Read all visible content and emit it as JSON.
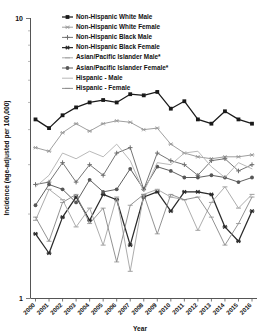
{
  "chart_data": {
    "type": "line",
    "title": "",
    "xlabel": "Year",
    "ylabel": "Incidence (age-adjusted per 100,000)",
    "yscale": "log",
    "ylim": [
      1,
      10
    ],
    "ytick_labels": [
      "10",
      "1"
    ],
    "ytick_values": [
      10,
      1
    ],
    "grid": false,
    "legend_position": "top-center",
    "categories": [
      "2000",
      "2001",
      "2002",
      "2003",
      "2004",
      "2005",
      "2006",
      "2007",
      "2008",
      "2009",
      "2010",
      "2011",
      "2012",
      "2013",
      "2014",
      "2015",
      "2016"
    ],
    "x": [
      2000,
      2001,
      2002,
      2003,
      2004,
      2005,
      2006,
      2007,
      2008,
      2009,
      2010,
      2011,
      2012,
      2013,
      2014,
      2015,
      2016
    ],
    "series": [
      {
        "name": "Non-Hispanic White Male",
        "marker": "filled-square",
        "color": "#1a1a1a",
        "values": [
          4.35,
          4.05,
          4.5,
          4.8,
          5.0,
          5.1,
          5.0,
          5.35,
          5.3,
          5.45,
          4.75,
          5.05,
          4.35,
          4.2,
          4.65,
          4.35,
          4.2
        ]
      },
      {
        "name": "Non-Hispanic White Female",
        "marker": "asterisk",
        "color": "#9a9a9a",
        "values": [
          3.45,
          3.35,
          3.9,
          4.2,
          3.95,
          4.2,
          4.3,
          4.25,
          4.0,
          4.05,
          3.55,
          3.3,
          3.2,
          3.15,
          3.2,
          3.2,
          3.25
        ]
      },
      {
        "name": "Non-Hispanic Black Male",
        "marker": "plus",
        "color": "#6e6e6e",
        "values": [
          2.55,
          2.6,
          3.05,
          2.6,
          3.0,
          2.75,
          3.3,
          3.45,
          2.45,
          3.3,
          3.1,
          3.0,
          2.75,
          3.1,
          3.15,
          2.85,
          3.0
        ]
      },
      {
        "name": "Non-Hispanic Black Female",
        "marker": "asterisk-bold",
        "color": "#2b2b2b",
        "values": [
          1.7,
          1.45,
          1.95,
          2.3,
          1.9,
          2.35,
          2.25,
          1.55,
          2.3,
          2.4,
          2.05,
          2.4,
          2.4,
          2.35,
          1.8,
          1.6,
          2.05
        ]
      },
      {
        "name": "Asian/Pacific Islander Male*",
        "marker": "dash",
        "color": "#a8a8a8",
        "values": [
          1.9,
          2.45,
          2.25,
          1.8,
          2.1,
          1.55,
          2.3,
          1.25,
          2.35,
          2.45,
          2.3,
          2.25,
          1.75,
          2.2,
          2.5,
          2.1,
          2.35
        ]
      },
      {
        "name": "Asian/Pacific Islander Female*",
        "marker": "filled-circle",
        "color": "#575757",
        "values": [
          2.15,
          2.55,
          2.45,
          2.2,
          2.65,
          2.4,
          2.45,
          2.9,
          2.45,
          2.95,
          2.85,
          2.7,
          2.7,
          2.75,
          2.7,
          2.6,
          2.7
        ]
      },
      {
        "name": "Hispanic - Male",
        "marker": "line-only",
        "color": "#b5b5b5",
        "values": [
          2.5,
          2.75,
          3.3,
          3.15,
          3.35,
          3.2,
          3.55,
          3.1,
          2.4,
          3.05,
          3.0,
          3.3,
          3.35,
          2.95,
          2.7,
          3.05,
          2.9
        ]
      },
      {
        "name": "Hispanic - Female",
        "marker": "dash-thin",
        "color": "#8c8c8c",
        "values": [
          1.95,
          1.6,
          2.2,
          2.35,
          1.85,
          2.1,
          1.35,
          2.15,
          2.35,
          1.7,
          2.35,
          2.25,
          2.3,
          1.95,
          1.55,
          1.85,
          2.3
        ]
      }
    ]
  }
}
